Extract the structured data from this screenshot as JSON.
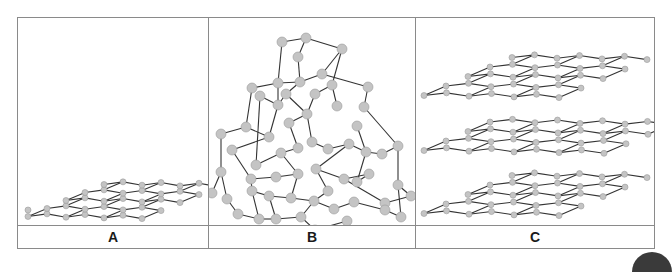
{
  "figure": {
    "panels": [
      {
        "id": "A",
        "label": "A",
        "structure": "single graphene sheet"
      },
      {
        "id": "B",
        "label": "B",
        "structure": "diamond lattice"
      },
      {
        "id": "C",
        "label": "C",
        "structure": "stacked graphite sheets"
      }
    ]
  },
  "colors": {
    "border": "#8a8a8a",
    "bond": "#333333",
    "atom_fill": "#c4c4c4",
    "atom_stroke": "#9a9a9a",
    "label_text": "#1a1a1a"
  }
}
